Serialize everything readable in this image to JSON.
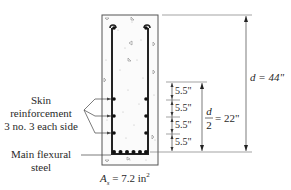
{
  "diagram": {
    "labels": {
      "skin_line1": "Skin",
      "skin_line2": "reinforcement",
      "skin_line3": "3 no. 3 each side",
      "main_line1": "Main flexural",
      "main_line2": "steel",
      "as_label": "A",
      "as_sub": "s",
      "as_value": " = 7.2 in",
      "as_exp": "2"
    },
    "dimensions": {
      "spacing": [
        "5.5\"",
        "5.5\"",
        "5.5\"",
        "5.5\""
      ],
      "half_depth_num": "d",
      "half_depth_den": "2",
      "half_depth_value": "= 22\"",
      "depth_label": "d = 44\""
    },
    "bars": {
      "skin_per_side": 3,
      "bottom_count": 6
    },
    "colors": {
      "line": "#333333",
      "concrete_speckle": "#b8b8b8",
      "bar": "#111111"
    }
  }
}
